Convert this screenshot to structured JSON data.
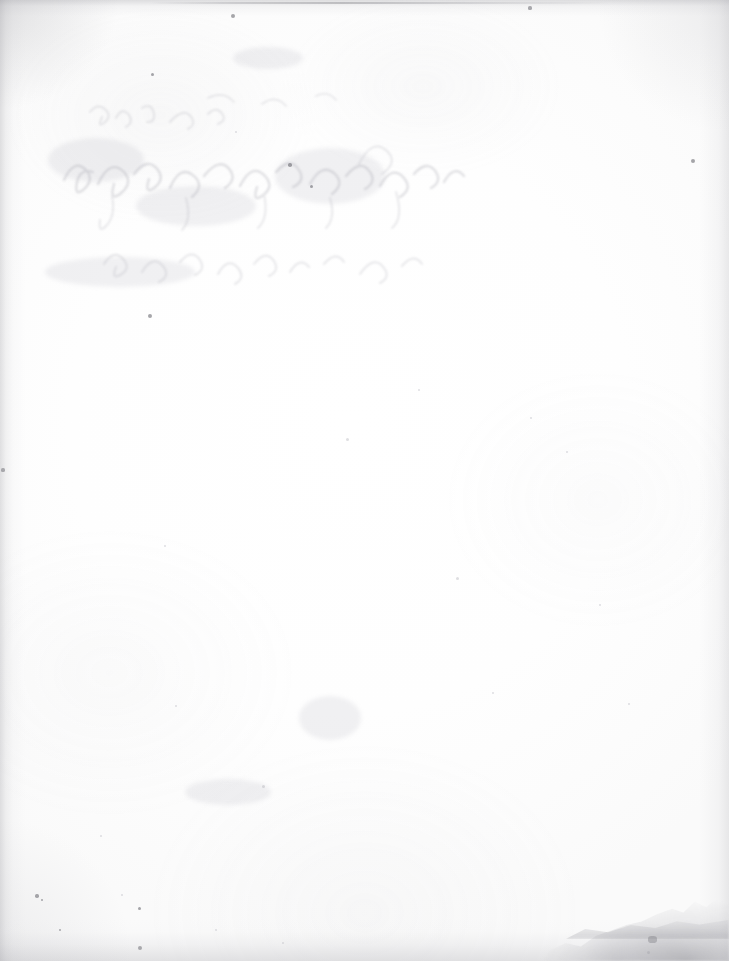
{
  "document": {
    "kind": "scanned-page",
    "surface_label": "blank page verso",
    "page_width": 729,
    "page_height": 961,
    "visible_text": "",
    "background_color": "#fefefe",
    "edge_shadow_color": "#a5a5aa",
    "ghost_ink_color": "#9a9aa4",
    "damage_color": "#78788 0"
  },
  "regions": {
    "ghost_writing": {
      "name": "bleed-through handwriting",
      "description": "illegible faint show-through script from reverse side",
      "x": 58,
      "y": 88,
      "width": 420,
      "height": 225,
      "legible": false,
      "transcription": ""
    },
    "torn_corner": {
      "name": "bottom-right torn corner",
      "x": 539,
      "y": 871,
      "width": 190,
      "height": 90
    },
    "edges": [
      {
        "name": "left-edge-shadow",
        "side": "left",
        "strength": 0.34
      },
      {
        "name": "right-edge-shadow",
        "side": "right",
        "strength": 0.26
      },
      {
        "name": "top-edge-shadow",
        "side": "top",
        "strength": 0.3
      },
      {
        "name": "bottom-edge-shadow",
        "side": "bottom",
        "strength": 0.3
      }
    ]
  },
  "specks": [
    {
      "x": 233,
      "y": 16,
      "r": 2.0,
      "tone": "dark"
    },
    {
      "x": 530,
      "y": 8,
      "r": 1.6,
      "tone": "dark"
    },
    {
      "x": 152,
      "y": 74,
      "r": 1.5,
      "tone": "dark"
    },
    {
      "x": 693,
      "y": 161,
      "r": 2.4,
      "tone": "dark"
    },
    {
      "x": 290,
      "y": 165,
      "r": 1.8,
      "tone": "dark"
    },
    {
      "x": 311,
      "y": 186,
      "r": 1.5,
      "tone": "dark"
    },
    {
      "x": 150,
      "y": 316,
      "r": 2.2,
      "tone": "dark"
    },
    {
      "x": 236,
      "y": 132,
      "r": 1.4,
      "tone": "soft"
    },
    {
      "x": 347,
      "y": 439,
      "r": 1.5,
      "tone": "soft"
    },
    {
      "x": 531,
      "y": 418,
      "r": 1.4,
      "tone": "soft"
    },
    {
      "x": 457,
      "y": 578,
      "r": 1.5,
      "tone": "soft"
    },
    {
      "x": 165,
      "y": 546,
      "r": 1.3,
      "tone": "soft"
    },
    {
      "x": 3,
      "y": 470,
      "r": 1.6,
      "tone": "dark"
    },
    {
      "x": 37,
      "y": 896,
      "r": 1.7,
      "tone": "dark"
    },
    {
      "x": 42,
      "y": 900,
      "r": 1.3,
      "tone": "dark"
    },
    {
      "x": 140,
      "y": 948,
      "r": 2.1,
      "tone": "dark"
    },
    {
      "x": 139,
      "y": 908,
      "r": 1.5,
      "tone": "dark"
    },
    {
      "x": 60,
      "y": 930,
      "r": 1.4,
      "tone": "dark"
    },
    {
      "x": 122,
      "y": 895,
      "r": 1.4,
      "tone": "soft"
    },
    {
      "x": 216,
      "y": 930,
      "r": 1.3,
      "tone": "soft"
    },
    {
      "x": 648,
      "y": 952,
      "r": 1.5,
      "tone": "soft"
    },
    {
      "x": 283,
      "y": 943,
      "r": 1.4,
      "tone": "soft"
    },
    {
      "x": 600,
      "y": 605,
      "r": 1.3,
      "tone": "soft"
    },
    {
      "x": 493,
      "y": 693,
      "r": 1.4,
      "tone": "soft"
    },
    {
      "x": 629,
      "y": 704,
      "r": 1.3,
      "tone": "soft"
    },
    {
      "x": 176,
      "y": 706,
      "r": 1.4,
      "tone": "soft"
    },
    {
      "x": 263,
      "y": 786,
      "r": 1.5,
      "tone": "soft"
    },
    {
      "x": 101,
      "y": 836,
      "r": 1.3,
      "tone": "soft"
    },
    {
      "x": 419,
      "y": 390,
      "r": 1.3,
      "tone": "soft"
    },
    {
      "x": 567,
      "y": 452,
      "r": 1.4,
      "tone": "soft"
    }
  ],
  "smudges": [
    {
      "x": 330,
      "y": 718,
      "w": 62,
      "h": 44
    },
    {
      "x": 228,
      "y": 792,
      "w": 86,
      "h": 26
    },
    {
      "x": 196,
      "y": 206,
      "w": 120,
      "h": 40
    },
    {
      "x": 330,
      "y": 176,
      "w": 110,
      "h": 56
    },
    {
      "x": 96,
      "y": 160,
      "w": 96,
      "h": 44
    },
    {
      "x": 120,
      "y": 272,
      "w": 150,
      "h": 30
    },
    {
      "x": 268,
      "y": 58,
      "w": 70,
      "h": 22
    }
  ]
}
